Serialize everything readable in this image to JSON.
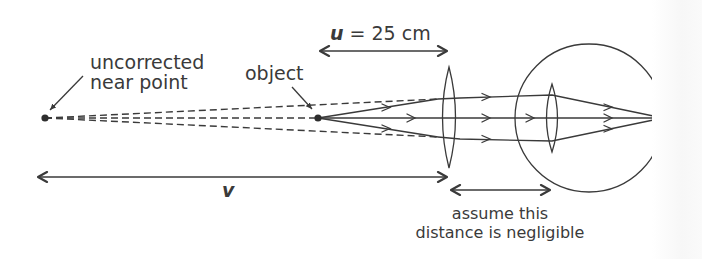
{
  "diagram": {
    "type": "optics-ray-diagram",
    "labels": {
      "near_point": [
        "uncorrected",
        "near point"
      ],
      "object": "object",
      "u_symbol": "u",
      "u_value": " = 25 cm",
      "v_symbol": "v",
      "negligible": [
        "assume this",
        "distance is negligible"
      ]
    },
    "elements": {
      "near_point_dot": {
        "x": 45,
        "y": 118
      },
      "object_dot": {
        "x": 318,
        "y": 118
      },
      "corrective_lens": {
        "cx": 449,
        "top": 67,
        "bottom": 168,
        "half_width": 13
      },
      "eyeball": {
        "cx": 589,
        "cy": 118,
        "r": 74
      },
      "eye_lens": {
        "cx": 552,
        "top": 84,
        "bottom": 152,
        "half_width": 11
      },
      "retina_focus": {
        "x": 663,
        "y": 118
      }
    },
    "dimensions": [
      {
        "name": "u",
        "y": 51,
        "x1": 320,
        "x2": 447
      },
      {
        "name": "v",
        "y": 177,
        "x1": 38,
        "x2": 447
      },
      {
        "name": "negligible",
        "y": 190,
        "x1": 451,
        "x2": 550
      }
    ],
    "colors": {
      "stroke": "#3a3a3a",
      "text": "#3a3a3a",
      "background": "#ffffff"
    }
  }
}
